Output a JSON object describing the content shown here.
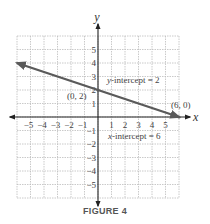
{
  "caption": "FIGURE 4",
  "colors": {
    "line": "#5a5a5a",
    "axis": "#222222",
    "grid": "#bdbdbd",
    "text": "#444444"
  },
  "chart_data": {
    "type": "line",
    "title": "",
    "xlabel": "x",
    "ylabel": "y",
    "xlim": [
      -6,
      6
    ],
    "ylim": [
      -6,
      6
    ],
    "grid": true,
    "x_ticks": [
      -5,
      -4,
      -3,
      -2,
      -1,
      1,
      2,
      3,
      4,
      5
    ],
    "y_ticks": [
      -5,
      -4,
      -3,
      -2,
      -1,
      1,
      2,
      3,
      4,
      5
    ],
    "x_tick_labels": [
      "−5",
      "−4",
      "−3",
      "−2",
      "−1",
      "1",
      "2",
      "3",
      "4",
      "5"
    ],
    "y_tick_labels": [
      "−5",
      "−4",
      "−3",
      "−2",
      "−1",
      "1",
      "2",
      "3",
      "4",
      "5"
    ],
    "series": [
      {
        "name": "line",
        "equation": "y = -x/3 + 2",
        "x": [
          -6,
          0,
          6
        ],
        "y": [
          4,
          2,
          0
        ],
        "arrows": "both"
      }
    ],
    "points": [
      {
        "x": 0,
        "y": 2,
        "label": "(0, 2)"
      },
      {
        "x": 6,
        "y": 0,
        "label": "(6, 0)"
      }
    ],
    "annotations": [
      {
        "text": "y-intercept = 2"
      },
      {
        "text": "x-intercept = 6"
      }
    ]
  }
}
